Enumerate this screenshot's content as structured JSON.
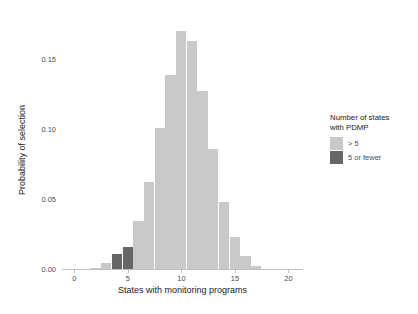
{
  "chart_data": {
    "type": "bar",
    "title": "",
    "xlabel": "States with monitoring programs",
    "ylabel": "Probability of selection",
    "xlim": [
      -0.6,
      20.8
    ],
    "ylim": [
      0.0,
      0.178
    ],
    "grid": false,
    "x_ticks": [
      "0",
      "5",
      "10",
      "15",
      "20"
    ],
    "x_tick_values": [
      0,
      5,
      10,
      15,
      20
    ],
    "y_ticks": [
      "0.00",
      "0.05",
      "0.10",
      "0.15"
    ],
    "y_tick_values": [
      0.0,
      0.05,
      0.1,
      0.15
    ],
    "bar_width_units": 1.0,
    "categories": [
      2,
      3,
      4,
      5,
      6,
      7,
      8,
      9,
      10,
      11,
      12,
      13,
      14,
      15,
      16,
      17
    ],
    "values": [
      0.001,
      0.004,
      0.011,
      0.016,
      0.034,
      0.062,
      0.101,
      0.139,
      0.17,
      0.163,
      0.127,
      0.086,
      0.048,
      0.023,
      0.009,
      0.002
    ],
    "colors": [
      "#c9c9c9",
      "#c9c9c9",
      "#666666",
      "#666666",
      "#c9c9c9",
      "#c9c9c9",
      "#c9c9c9",
      "#c9c9c9",
      "#c9c9c9",
      "#c9c9c9",
      "#c9c9c9",
      "#c9c9c9",
      "#c9c9c9",
      "#c9c9c9",
      "#c9c9c9",
      "#c9c9c9"
    ],
    "series": [
      {
        "name": "> 5",
        "color": "#c9c9c9",
        "x": [
          2,
          3,
          6,
          7,
          8,
          9,
          10,
          11,
          12,
          13,
          14,
          15,
          16,
          17
        ],
        "values": [
          0.001,
          0.004,
          0.034,
          0.062,
          0.101,
          0.139,
          0.17,
          0.163,
          0.127,
          0.086,
          0.048,
          0.023,
          0.009,
          0.002
        ]
      },
      {
        "name": "5 or fewer",
        "color": "#666666",
        "x": [
          4,
          5
        ],
        "values": [
          0.011,
          0.016
        ]
      }
    ],
    "legend": {
      "position": "right",
      "title": "Number of states\nwith PDMP",
      "entries": [
        {
          "label": "> 5",
          "color": "#c9c9c9"
        },
        {
          "label": "5 or fewer",
          "color": "#666666"
        }
      ]
    }
  },
  "colors": {
    "light_gray_bar": "#c9c9c9",
    "dark_gray_bar": "#666666",
    "axis": "#bfbfbf",
    "text": "#4d4d4d",
    "title_text": "#1a1a1a",
    "background": "#ffffff"
  }
}
